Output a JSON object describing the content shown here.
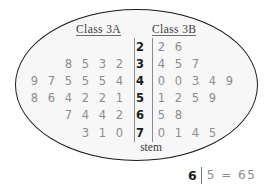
{
  "headers": {
    "left": "Class 3A",
    "right": "Class 3B"
  },
  "stem_label": "stem",
  "key": {
    "stem": "6",
    "expression": "5 = 65"
  },
  "colors": {
    "outline": "#1a1a1a",
    "fill": "#f7f7f7",
    "leaf_text": "#8d8d8d",
    "stem_text": "#1c1c1c",
    "header_text": "#3b3b3b",
    "rule": "#8a8a8a"
  },
  "chart_data": {
    "type": "table",
    "title": "",
    "subtitle": "",
    "chart_kind": "back-to-back stem-and-leaf plot",
    "left_label": "Class 3A",
    "right_label": "Class 3B",
    "stem_axis_label": "stem",
    "key": "6 | 5 = 65",
    "stems": [
      2,
      3,
      4,
      5,
      6,
      7
    ],
    "left_leaves": [
      [],
      [
        8,
        5,
        3,
        2
      ],
      [
        9,
        7,
        5,
        5,
        5,
        4
      ],
      [
        8,
        6,
        4,
        2,
        2,
        1
      ],
      [
        7,
        4,
        4,
        2
      ],
      [
        3,
        1,
        0
      ]
    ],
    "right_leaves": [
      [
        2,
        6
      ],
      [
        4,
        5,
        7
      ],
      [
        0,
        0,
        3,
        4,
        9
      ],
      [
        1,
        2,
        5,
        9
      ],
      [
        5,
        8
      ],
      [
        0,
        1,
        4,
        5
      ]
    ],
    "left_values": [
      [],
      [
        32,
        33,
        35,
        38
      ],
      [
        44,
        45,
        45,
        45,
        47,
        49
      ],
      [
        51,
        52,
        52,
        54,
        56,
        58
      ],
      [
        62,
        64,
        64,
        67
      ],
      [
        70,
        71,
        73
      ]
    ],
    "right_values": [
      [
        22,
        26
      ],
      [
        34,
        35,
        37
      ],
      [
        40,
        40,
        43,
        44,
        49
      ],
      [
        51,
        52,
        55,
        59
      ],
      [
        65,
        68
      ],
      [
        70,
        71,
        74,
        75
      ]
    ],
    "left_count": 23,
    "right_count": 20,
    "grid": false,
    "legend": "none"
  }
}
